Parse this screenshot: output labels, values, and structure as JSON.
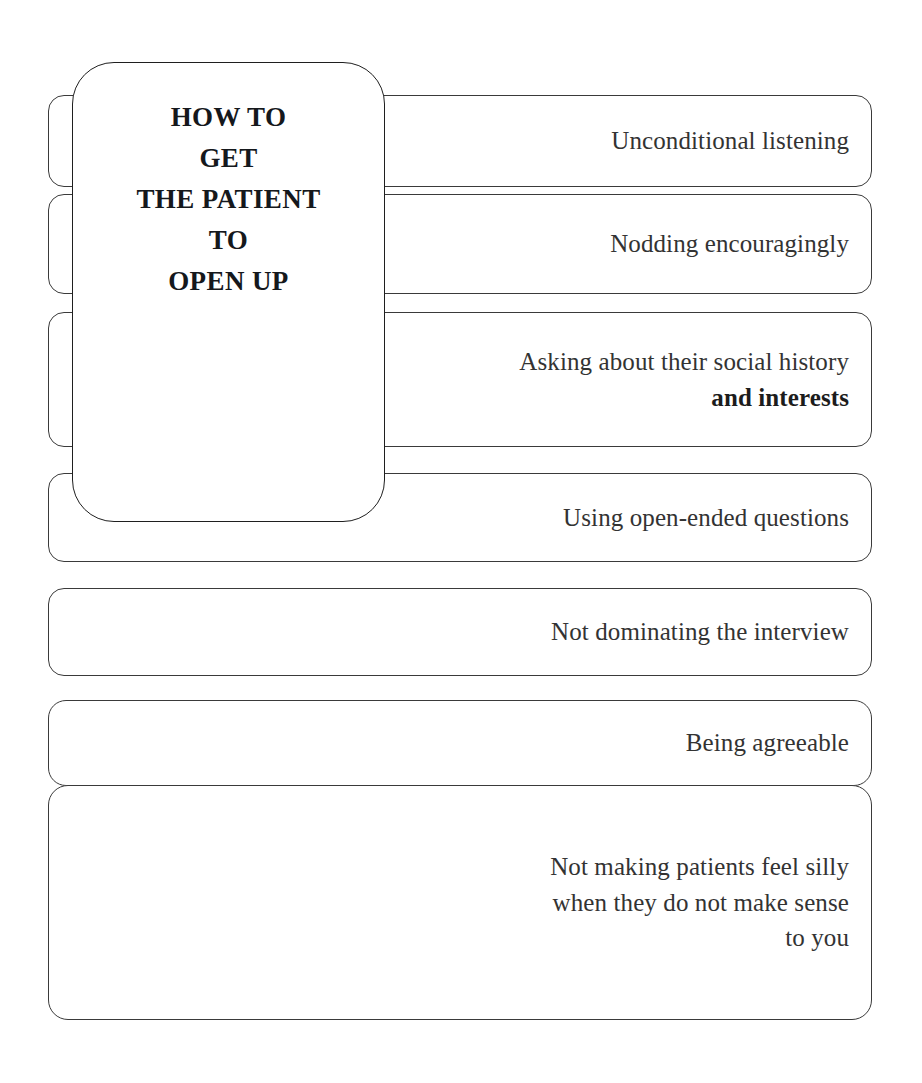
{
  "diagram": {
    "title_lines": [
      "HOW TO",
      "GET",
      "THE PATIENT",
      "TO",
      "OPEN UP"
    ],
    "stroke_color": "#3a3a3a",
    "text_color": "#333333",
    "background_color": "#ffffff",
    "branches": [
      {
        "id": "unconditional-listening",
        "lines": [
          {
            "text": "Unconditional listening",
            "emphasis": false
          }
        ]
      },
      {
        "id": "nodding-encouragingly",
        "lines": [
          {
            "text": "Nodding encouragingly",
            "emphasis": false
          }
        ]
      },
      {
        "id": "social-history-and-interests",
        "lines": [
          {
            "text": "Asking about their social history",
            "emphasis": false
          },
          {
            "text": "and interests",
            "emphasis": true
          }
        ]
      },
      {
        "id": "open-ended-questions",
        "lines": [
          {
            "text": "Using open-ended questions",
            "emphasis": false
          }
        ]
      },
      {
        "id": "not-dominating-the-interview",
        "lines": [
          {
            "text": "Not dominating the interview",
            "emphasis": false
          }
        ]
      },
      {
        "id": "being-agreeable",
        "lines": [
          {
            "text": "Being agreeable",
            "emphasis": false
          }
        ]
      },
      {
        "id": "not-making-patients-feel-silly",
        "lines": [
          {
            "text": "Not making patients feel silly",
            "emphasis": false
          },
          {
            "text": "when they do not make sense",
            "emphasis": false
          },
          {
            "text": "to you",
            "emphasis": false
          }
        ]
      }
    ]
  }
}
